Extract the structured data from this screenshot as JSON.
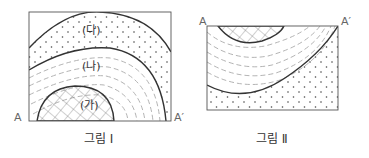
{
  "figure1": {
    "caption": "그림 Ⅰ",
    "left_label": "A",
    "right_label": "A′",
    "units": [
      {
        "label": "(다)",
        "pattern": "dots"
      },
      {
        "label": "(나)",
        "pattern": "dashed"
      },
      {
        "label": "(가)",
        "pattern": "crosshatch"
      }
    ]
  },
  "figure2": {
    "caption": "그림 Ⅱ",
    "left_label": "A",
    "right_label": "A′"
  },
  "colors": {
    "line": "#333333",
    "dash": "#aaaaaa",
    "dot": "#444444",
    "hatch": "#777777"
  }
}
